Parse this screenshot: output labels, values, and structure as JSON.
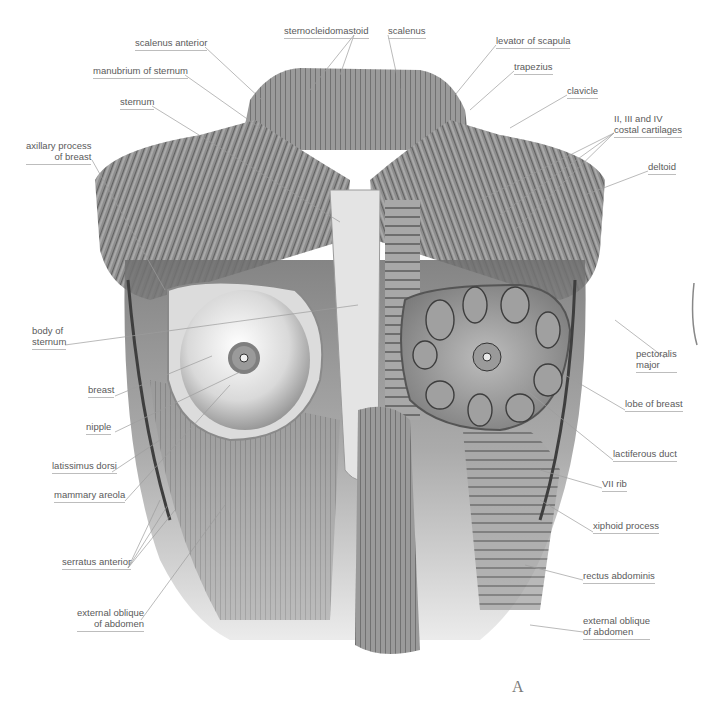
{
  "figure": {
    "panel_letter": "A"
  },
  "labels": {
    "scalenus_anterior": {
      "line1": "scalenus anterior",
      "x": 135,
      "y": 37,
      "align": "left"
    },
    "sternocleidomastoid": {
      "line1": "sternocleidomastoid",
      "x": 284,
      "y": 25,
      "align": "left"
    },
    "scalenus": {
      "line1": "scalenus",
      "x": 388,
      "y": 25,
      "align": "left"
    },
    "levator_of_scapula": {
      "line1": "levator of scapula",
      "x": 496,
      "y": 35,
      "align": "left"
    },
    "manubrium_of_sternum": {
      "line1": "manubrium of sternum",
      "x": 93,
      "y": 65,
      "align": "left"
    },
    "trapezius": {
      "line1": "trapezius",
      "x": 514,
      "y": 61,
      "align": "left"
    },
    "sternum": {
      "line1": "sternum",
      "x": 120,
      "y": 96,
      "align": "left"
    },
    "clavicle": {
      "line1": "clavicle",
      "x": 567,
      "y": 85,
      "align": "left"
    },
    "costal_cartilages": {
      "line1": "II, III and IV",
      "line2": "costal cartilages",
      "x": 614,
      "y": 113,
      "align": "left"
    },
    "axillary_process_of_breast": {
      "line1": "axillary process",
      "line2": "of breast",
      "x": 26,
      "y": 140,
      "align": "right"
    },
    "deltoid": {
      "line1": "deltoid",
      "x": 648,
      "y": 161,
      "align": "left"
    },
    "body_of_sternum": {
      "line1": "body of",
      "line2": "sternum",
      "x": 32,
      "y": 325,
      "align": "left"
    },
    "pectoralis_major": {
      "line1": "pectoralis",
      "line2": "major",
      "x": 636,
      "y": 348,
      "align": "left"
    },
    "breast": {
      "line1": "breast",
      "x": 88,
      "y": 384,
      "align": "left"
    },
    "lobe_of_breast": {
      "line1": "lobe of breast",
      "x": 625,
      "y": 398,
      "align": "left"
    },
    "nipple": {
      "line1": "nipple",
      "x": 86,
      "y": 421,
      "align": "left"
    },
    "lactiferous_duct": {
      "line1": "lactiferous duct",
      "x": 613,
      "y": 448,
      "align": "left"
    },
    "latissimus_dorsi": {
      "line1": "latissimus dorsi",
      "x": 52,
      "y": 460,
      "align": "left"
    },
    "mammary_areola": {
      "line1": "mammary areola",
      "x": 54,
      "y": 489,
      "align": "left"
    },
    "vii_rib": {
      "line1": "VII rib",
      "x": 602,
      "y": 478,
      "align": "left"
    },
    "xiphoid_process": {
      "line1": "xiphoid process",
      "x": 593,
      "y": 520,
      "align": "left"
    },
    "serratus_anterior": {
      "line1": "serratus anterior",
      "x": 62,
      "y": 556,
      "align": "left"
    },
    "rectus_abdominis": {
      "line1": "rectus abdominis",
      "x": 583,
      "y": 570,
      "align": "left"
    },
    "external_oblique_left": {
      "line1": "external oblique",
      "line2": "of abdomen",
      "x": 77,
      "y": 607,
      "align": "right"
    },
    "external_oblique_right": {
      "line1": "external oblique",
      "line2": "of abdomen",
      "x": 583,
      "y": 615,
      "align": "left"
    }
  },
  "leaders": [
    {
      "x1": 205,
      "y1": 47,
      "x2": 262,
      "y2": 100
    },
    {
      "x1": 354,
      "y1": 35,
      "x2": 310,
      "y2": 90
    },
    {
      "x1": 354,
      "y1": 35,
      "x2": 340,
      "y2": 75
    },
    {
      "x1": 388,
      "y1": 35,
      "x2": 400,
      "y2": 90
    },
    {
      "x1": 496,
      "y1": 45,
      "x2": 455,
      "y2": 95
    },
    {
      "x1": 185,
      "y1": 75,
      "x2": 260,
      "y2": 128
    },
    {
      "x1": 514,
      "y1": 71,
      "x2": 470,
      "y2": 110
    },
    {
      "x1": 152,
      "y1": 106,
      "x2": 340,
      "y2": 222
    },
    {
      "x1": 567,
      "y1": 95,
      "x2": 510,
      "y2": 128
    },
    {
      "x1": 614,
      "y1": 133,
      "x2": 480,
      "y2": 200
    },
    {
      "x1": 614,
      "y1": 133,
      "x2": 500,
      "y2": 215
    },
    {
      "x1": 614,
      "y1": 133,
      "x2": 515,
      "y2": 230
    },
    {
      "x1": 92,
      "y1": 160,
      "x2": 165,
      "y2": 290
    },
    {
      "x1": 648,
      "y1": 171,
      "x2": 585,
      "y2": 195
    },
    {
      "x1": 65,
      "y1": 345,
      "x2": 358,
      "y2": 305
    },
    {
      "x1": 665,
      "y1": 358,
      "x2": 615,
      "y2": 320
    },
    {
      "x1": 115,
      "y1": 396,
      "x2": 212,
      "y2": 356
    },
    {
      "x1": 625,
      "y1": 410,
      "x2": 565,
      "y2": 375
    },
    {
      "x1": 115,
      "y1": 432,
      "x2": 240,
      "y2": 372
    },
    {
      "x1": 613,
      "y1": 460,
      "x2": 520,
      "y2": 385
    },
    {
      "x1": 112,
      "y1": 472,
      "x2": 160,
      "y2": 440
    },
    {
      "x1": 125,
      "y1": 501,
      "x2": 230,
      "y2": 385
    },
    {
      "x1": 602,
      "y1": 488,
      "x2": 540,
      "y2": 470
    },
    {
      "x1": 593,
      "y1": 532,
      "x2": 540,
      "y2": 500
    },
    {
      "x1": 128,
      "y1": 568,
      "x2": 160,
      "y2": 500
    },
    {
      "x1": 128,
      "y1": 568,
      "x2": 168,
      "y2": 505
    },
    {
      "x1": 128,
      "y1": 568,
      "x2": 175,
      "y2": 510
    },
    {
      "x1": 583,
      "y1": 580,
      "x2": 525,
      "y2": 565
    },
    {
      "x1": 141,
      "y1": 620,
      "x2": 225,
      "y2": 505
    },
    {
      "x1": 583,
      "y1": 632,
      "x2": 530,
      "y2": 625
    }
  ]
}
